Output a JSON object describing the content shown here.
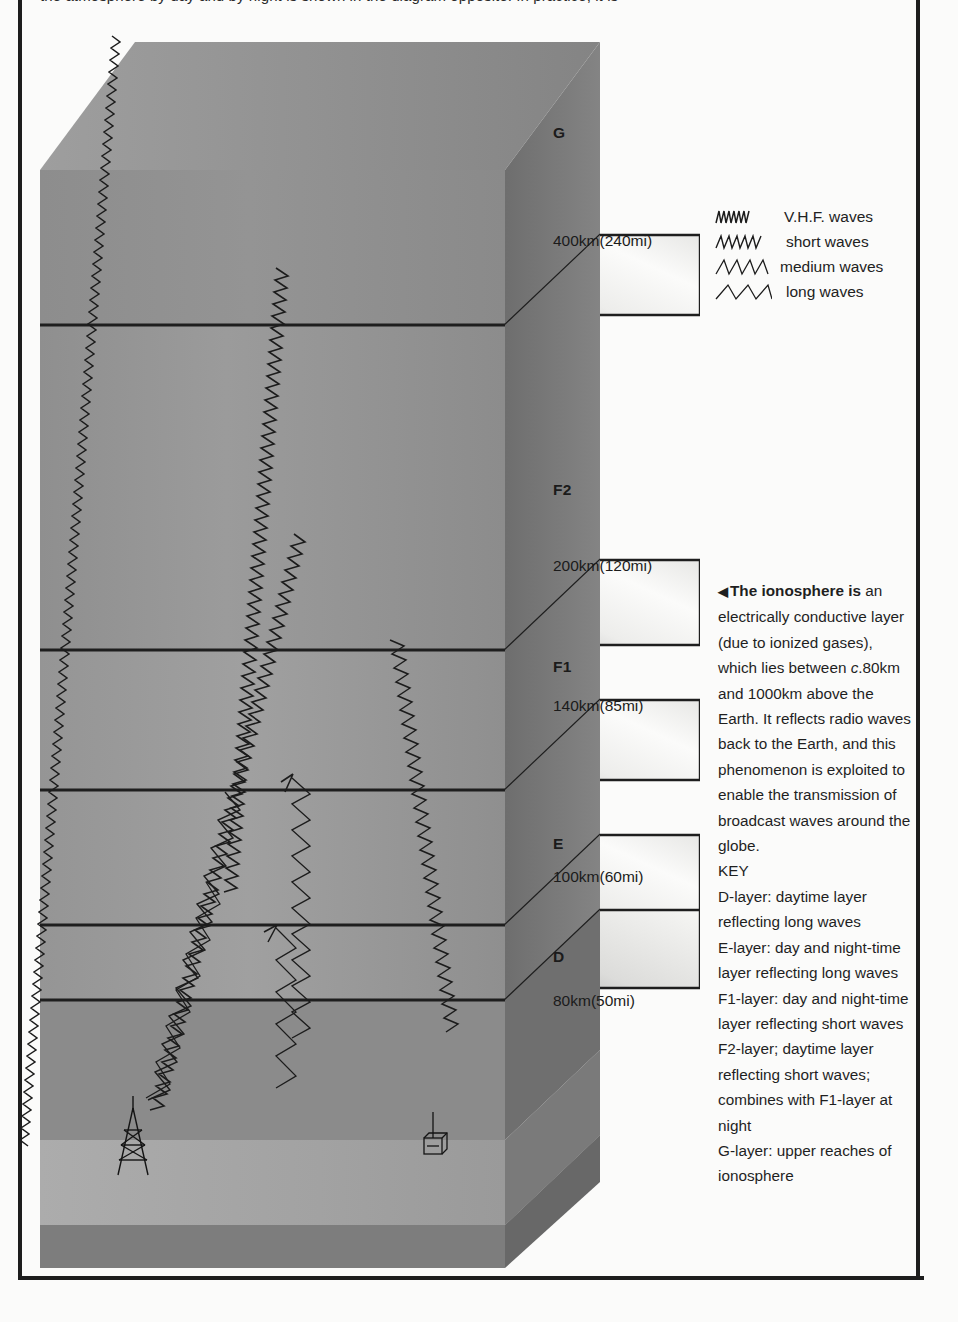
{
  "page": {
    "clipped_top_text": "the atmosphere by day and by night is shown in the diagram opposite. In practice, it is",
    "background_color": "#fbfbfa",
    "rule_color": "#1d1d1d"
  },
  "legend": {
    "items": [
      {
        "glyph": "vhf-wave-icon",
        "label": "V.H.F. waves"
      },
      {
        "glyph": "short-wave-icon",
        "label": "short waves"
      },
      {
        "glyph": "medium-wave-icon",
        "label": "medium waves"
      },
      {
        "glyph": "long-wave-icon",
        "label": "long waves"
      }
    ]
  },
  "caption": {
    "arrow": "◀",
    "lead": "The ionosphere is",
    "body_1": " an electrically conductive layer (due to ionized gases), which lies between ",
    "italic_c": "c",
    "body_2": ".80km and 1000km above the Earth. It reflects radio waves back to the Earth, and this phenomenon is exploited to enable the transmission of broadcast waves around the globe.",
    "key_heading": "KEY",
    "key_entries": [
      "D-layer: daytime layer reflecting long waves",
      "E-layer: day and night-time layer reflecting long waves",
      "F1-layer: day and night-time layer reflecting short waves",
      "F2-layer; daytime layer reflecting short waves; combines with F1-layer at night",
      "G-layer: upper reaches of ionosphere"
    ]
  },
  "diagram": {
    "title_hidden": "Ionospheric layers and radio wave propagation",
    "layer_names": [
      "G",
      "F2",
      "F1",
      "E",
      "D"
    ],
    "altitude_labels": [
      "400km(240mi)",
      "200km(120mi)",
      "140km(85mi)",
      "100km(60mi)",
      "80km(50mi)"
    ],
    "layers": [
      {
        "name": "G",
        "top_altitude_km": null,
        "boundary_label": "400km(240mi)"
      },
      {
        "name": "F2",
        "top_altitude_km": 400,
        "boundary_label": "200km(120mi)"
      },
      {
        "name": "F1",
        "top_altitude_km": 200,
        "boundary_label": "140km(85mi)"
      },
      {
        "name": "E",
        "top_altitude_km": 140,
        "boundary_label": "100km(60mi)"
      },
      {
        "name": "D",
        "top_altitude_km": 100,
        "boundary_label": "80km(50mi)"
      }
    ],
    "objects": [
      {
        "name": "transmitter-mast",
        "label": ""
      },
      {
        "name": "receiver-building",
        "label": ""
      }
    ],
    "colors": {
      "block_front": "#9a9a9a",
      "block_top": "#8e8e8e",
      "block_side": "#707070",
      "ground_top": "#a6a6a6",
      "ground_front": "#828282",
      "slab_light": "#f2f2f0",
      "wave_stroke": "#1c1c1c"
    }
  }
}
